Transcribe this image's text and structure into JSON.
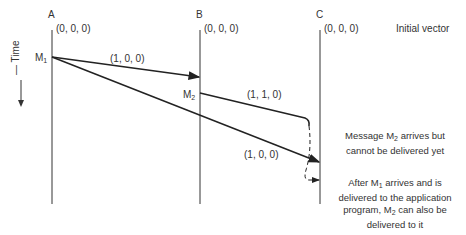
{
  "processes": [
    {
      "name": "A",
      "initial": "(0, 0, 0)"
    },
    {
      "name": "B",
      "initial": "(0, 0, 0)"
    },
    {
      "name": "C",
      "initial": "(0, 0, 0)"
    }
  ],
  "initial_vector_label": "Initial vector",
  "time_label": "Time",
  "messages": [
    {
      "name": "M",
      "sub": "1",
      "vector_to_B": "(1, 0, 0)",
      "vector_to_C": "(1, 0, 0)"
    },
    {
      "name": "M",
      "sub": "2",
      "vector": "(1, 1, 0)"
    }
  ],
  "notes": {
    "m2_pending_a": "Message M",
    "m2_pending_sub": "2",
    "m2_pending_b": " arrives but",
    "m2_pending_c": "cannot be delivered yet",
    "after_a": "After M",
    "after_sub1": "1",
    "after_b": " arrives and is",
    "after_c": "delivered to the application",
    "after_d": "program, M",
    "after_sub2": "2",
    "after_e": " can also be",
    "after_f": "delivered to it"
  }
}
